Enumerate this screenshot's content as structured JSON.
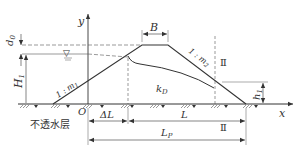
{
  "diagram": {
    "type": "earth-dam-seepage-cross-section",
    "axes": {
      "x_label": "x",
      "y_label": "y",
      "origin_label": "O"
    },
    "labels": {
      "crest_width": "B",
      "freeboard": "d",
      "freeboard_sub": "0",
      "upstream_head": "H",
      "upstream_head_sub": "1",
      "downstream_head": "h",
      "downstream_head_sub": "1",
      "upstream_slope": "1 : m",
      "upstream_slope_sub": "1",
      "downstream_slope": "1 : m",
      "downstream_slope_sub": "2",
      "permeability": "k",
      "permeability_sub": "D",
      "section_mark_top": "Ⅱ",
      "section_mark_bottom": "Ⅱ",
      "delta_L": "ΔL",
      "L": "L",
      "Lp": "L",
      "Lp_sub": "P",
      "impermeable_layer": "不透水层",
      "water_level_symbol": "▽"
    },
    "colors": {
      "line": "#333333",
      "background": "#ffffff"
    }
  }
}
